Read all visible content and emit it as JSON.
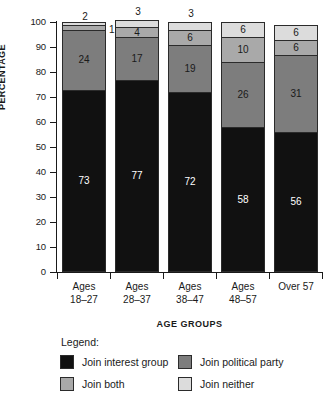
{
  "chart_data": {
    "type": "bar",
    "subtype": "stacked-vertical-100",
    "title": "",
    "xlabel": "AGE GROUPS",
    "ylabel": "PERCENTAGE",
    "ylim": [
      0,
      100
    ],
    "yticks": [
      0,
      10,
      20,
      30,
      40,
      50,
      60,
      70,
      80,
      90,
      100
    ],
    "ytick_labels": [
      "0",
      "10",
      "20",
      "30",
      "40",
      "50",
      "60",
      "70",
      "80",
      "90",
      "100"
    ],
    "grid": false,
    "legend_position": "below-axes",
    "legend_title": "Legend:",
    "categories": [
      "Ages 18–27",
      "Ages 28–37",
      "Ages 38–47",
      "Ages 48–57",
      "Over 57"
    ],
    "category_lines": [
      [
        "Ages",
        "18–27"
      ],
      [
        "Ages",
        "28–37"
      ],
      [
        "Ages",
        "38–47"
      ],
      [
        "Ages",
        "48–57"
      ],
      [
        "Over 57",
        ""
      ]
    ],
    "series": [
      {
        "name": "Join interest group",
        "color": "#111111",
        "values": [
          73,
          77,
          72,
          58,
          56
        ]
      },
      {
        "name": "Join political party",
        "color": "#7d7d7d",
        "values": [
          24,
          17,
          19,
          26,
          31
        ]
      },
      {
        "name": "Join both",
        "color": "#a9a9a9",
        "values": [
          2,
          4,
          6,
          10,
          6
        ]
      },
      {
        "name": "Join neither",
        "color": "#dcdcdc",
        "values": [
          1,
          3,
          3,
          6,
          6
        ]
      }
    ],
    "bars": [
      {
        "category": "Ages 18–27",
        "segments": [
          {
            "series": "Join interest group",
            "value": 73,
            "label": "73",
            "label_placement": "inside",
            "label_color": "light"
          },
          {
            "series": "Join political party",
            "value": 24,
            "label": "24",
            "label_placement": "inside",
            "label_color": "dark"
          },
          {
            "series": "Join both",
            "value": 2,
            "label": "2",
            "label_placement": "above",
            "label_color": "dark"
          },
          {
            "series": "Join neither",
            "value": 1,
            "label": "1",
            "label_placement": "right",
            "label_color": "dark"
          }
        ]
      },
      {
        "category": "Ages 28–37",
        "segments": [
          {
            "series": "Join interest group",
            "value": 77,
            "label": "77",
            "label_placement": "inside",
            "label_color": "light"
          },
          {
            "series": "Join political party",
            "value": 17,
            "label": "17",
            "label_placement": "inside",
            "label_color": "dark"
          },
          {
            "series": "Join both",
            "value": 4,
            "label": "4",
            "label_placement": "inside",
            "label_color": "dark"
          },
          {
            "series": "Join neither",
            "value": 3,
            "label": "3",
            "label_placement": "above",
            "label_color": "dark"
          }
        ]
      },
      {
        "category": "Ages 38–47",
        "segments": [
          {
            "series": "Join interest group",
            "value": 72,
            "label": "72",
            "label_placement": "inside",
            "label_color": "light"
          },
          {
            "series": "Join political party",
            "value": 19,
            "label": "19",
            "label_placement": "inside",
            "label_color": "dark"
          },
          {
            "series": "Join both",
            "value": 6,
            "label": "6",
            "label_placement": "inside",
            "label_color": "dark"
          },
          {
            "series": "Join neither",
            "value": 3,
            "label": "3",
            "label_placement": "above",
            "label_color": "dark"
          }
        ]
      },
      {
        "category": "Ages 48–57",
        "segments": [
          {
            "series": "Join interest group",
            "value": 58,
            "label": "58",
            "label_placement": "inside",
            "label_color": "light"
          },
          {
            "series": "Join political party",
            "value": 26,
            "label": "26",
            "label_placement": "inside",
            "label_color": "dark"
          },
          {
            "series": "Join both",
            "value": 10,
            "label": "10",
            "label_placement": "inside",
            "label_color": "dark"
          },
          {
            "series": "Join neither",
            "value": 6,
            "label": "6",
            "label_placement": "inside",
            "label_color": "dark"
          }
        ]
      },
      {
        "category": "Over 57",
        "segments": [
          {
            "series": "Join interest group",
            "value": 56,
            "label": "56",
            "label_placement": "inside",
            "label_color": "light"
          },
          {
            "series": "Join political party",
            "value": 31,
            "label": "31",
            "label_placement": "inside",
            "label_color": "dark"
          },
          {
            "series": "Join both",
            "value": 6,
            "label": "6",
            "label_placement": "inside",
            "label_color": "dark"
          },
          {
            "series": "Join neither",
            "value": 6,
            "label": "6",
            "label_placement": "inside",
            "label_color": "dark"
          }
        ]
      }
    ]
  },
  "legend": {
    "title": "Legend:",
    "items": [
      {
        "label": "Join interest group",
        "color": "#111111"
      },
      {
        "label": "Join political party",
        "color": "#7d7d7d"
      },
      {
        "label": "Join both",
        "color": "#a9a9a9"
      },
      {
        "label": "Join neither",
        "color": "#dcdcdc"
      }
    ]
  },
  "axes": {
    "y_title": "PERCENTAGE",
    "x_title": "AGE GROUPS"
  }
}
